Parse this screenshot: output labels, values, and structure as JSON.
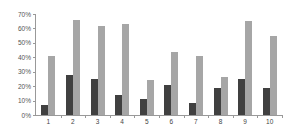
{
  "chart_data": {
    "type": "bar",
    "title": "",
    "xlabel": "",
    "ylabel": "",
    "categories": [
      "1",
      "2",
      "3",
      "4",
      "5",
      "6",
      "7",
      "8",
      "9",
      "10"
    ],
    "series": [
      {
        "name": "Series 1",
        "color": "#404040",
        "values": [
          7,
          28,
          25,
          14,
          11,
          21,
          8,
          19,
          25,
          19
        ]
      },
      {
        "name": "Series 2",
        "color": "#a6a6a6",
        "values": [
          41,
          66,
          62,
          63,
          24,
          44,
          41,
          26,
          65,
          55
        ]
      }
    ],
    "ylim": [
      0,
      70
    ],
    "yticks": [
      "0%",
      "10%",
      "20%",
      "30%",
      "40%",
      "50%",
      "60%",
      "70%"
    ],
    "grid": false,
    "legend": "none"
  }
}
